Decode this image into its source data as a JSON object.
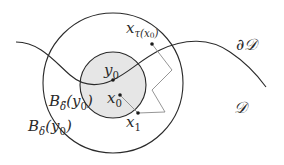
{
  "diagram": {
    "background": "#ffffff",
    "stroke_color": "#2a2a2a",
    "path_color": "#8a8a8a",
    "fill_inner": "#e6e6e6",
    "outer_circle": {
      "cx": 113,
      "cy": 83,
      "r": 70,
      "label": "B_δ(y_0)"
    },
    "inner_circle": {
      "cx": 113,
      "cy": 85,
      "r": 33,
      "label": "B_δ̃(y_0)"
    },
    "boundary_curve": {
      "label": "∂D"
    },
    "domain_label": "D",
    "points": [
      {
        "id": "y0",
        "label": "y0",
        "x": 113,
        "y": 80
      },
      {
        "id": "x0",
        "label": "x0",
        "x": 120,
        "y": 95
      },
      {
        "id": "x1",
        "label": "x1",
        "x": 138,
        "y": 113
      },
      {
        "id": "x_tau",
        "label": "xτ(x0)",
        "x": 152,
        "y": 44
      }
    ]
  },
  "labels": {
    "y0_main": "y",
    "y0_sub": "0",
    "x0_main": "x",
    "x0_sub": "0",
    "x1_main": "x",
    "x1_sub": "1",
    "xtau_main": "x",
    "xtau_sub": "τ(x",
    "xtau_sub2": "0",
    "xtau_close": ")",
    "boundary": "∂𝒟",
    "domain": "𝒟",
    "b_tilde_main": "B",
    "b_tilde_sub": "δ̃",
    "b_tilde_arg": "(y",
    "b_tilde_arg_sub": "0",
    "b_tilde_close": ")",
    "b_main": "B",
    "b_sub": "δ",
    "b_arg": "(y",
    "b_arg_sub": "0",
    "b_close": ")"
  }
}
